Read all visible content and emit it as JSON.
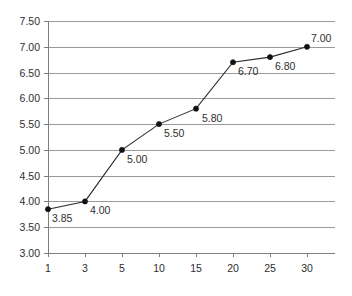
{
  "chart_data": {
    "type": "line",
    "title": "",
    "subtitle": "",
    "xlabel": "",
    "ylabel": "",
    "categories": [
      "1",
      "3",
      "5",
      "10",
      "15",
      "20",
      "25",
      "30"
    ],
    "values": [
      3.85,
      4.0,
      5.0,
      5.5,
      5.8,
      6.7,
      6.8,
      7.0
    ],
    "point_labels": [
      "3.85",
      "4.00",
      "5.00",
      "5.50",
      "5.80",
      "6.70",
      "6.80",
      "7.00"
    ],
    "series": [
      {
        "name": "",
        "values": [
          3.85,
          4.0,
          5.0,
          5.5,
          5.8,
          6.7,
          6.8,
          7.0
        ]
      }
    ],
    "ylim": [
      3.0,
      7.5
    ],
    "ytick_step": 0.5,
    "ytick_labels": [
      "7.50",
      "7.00",
      "6.50",
      "6.00",
      "5.50",
      "5.00",
      "4.50",
      "4.00",
      "3.50",
      "3.00"
    ],
    "ytick_values": [
      7.5,
      7.0,
      6.5,
      6.0,
      5.5,
      5.0,
      4.5,
      4.0,
      3.5,
      3.0
    ],
    "xtick_labels": [
      "1",
      "3",
      "5",
      "10",
      "15",
      "20",
      "25",
      "30"
    ],
    "grid": "horizontal",
    "legend": "none",
    "colors": {
      "line": "#2b2b2b",
      "marker": "#111111",
      "gridline": "#9a9a9a",
      "axis": "#7d7d7d",
      "text": "#2e2e2e",
      "background": "#ffffff"
    },
    "label_offsets": [
      {
        "dx": 4,
        "dy": 13
      },
      {
        "dx": 5,
        "dy": 13
      },
      {
        "dx": 5,
        "dy": 13
      },
      {
        "dx": 5,
        "dy": 13
      },
      {
        "dx": 6,
        "dy": 13
      },
      {
        "dx": 5,
        "dy": 13
      },
      {
        "dx": 5,
        "dy": 13
      },
      {
        "dx": 4,
        "dy": -5
      }
    ]
  }
}
